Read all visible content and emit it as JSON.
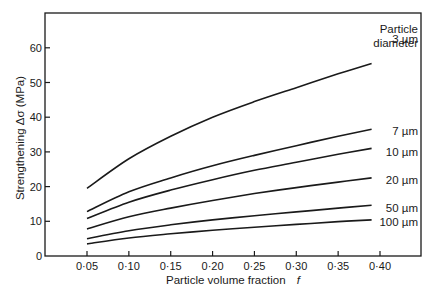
{
  "chart_data": {
    "type": "line",
    "title": "",
    "xlabel": "Particle volume fraction",
    "xlabel_symbol": "f",
    "ylabel": "Strengthening Δσ (MPa)",
    "xlim": [
      0.0,
      0.45
    ],
    "ylim": [
      0,
      70
    ],
    "x_ticks": [
      0.05,
      0.1,
      0.15,
      0.2,
      0.25,
      0.3,
      0.35,
      0.4
    ],
    "x_tick_labels": [
      "0·05",
      "0·10",
      "0·15",
      "0·20",
      "0·25",
      "0·30",
      "0·35",
      "0·40"
    ],
    "y_ticks": [
      0,
      10,
      20,
      30,
      40,
      50,
      60
    ],
    "y_tick_labels": [
      "0",
      "10",
      "20",
      "30",
      "40",
      "50",
      "60"
    ],
    "grid": false,
    "legend_title": [
      "Particle",
      "diameter"
    ],
    "legend_position": "right, inline labels at curve ends",
    "x": [
      0.05,
      0.1,
      0.15,
      0.2,
      0.25,
      0.3,
      0.35,
      0.39
    ],
    "series": [
      {
        "name": "3 µm",
        "values": [
          19.5,
          28.0,
          34.5,
          40.0,
          44.5,
          48.5,
          52.5,
          55.5
        ]
      },
      {
        "name": "7 µm",
        "values": [
          12.8,
          18.5,
          22.5,
          26.0,
          29.0,
          31.8,
          34.5,
          36.5
        ]
      },
      {
        "name": "10 µm",
        "values": [
          10.8,
          15.5,
          19.0,
          22.0,
          24.7,
          27.0,
          29.3,
          31.0
        ]
      },
      {
        "name": "20 µm",
        "values": [
          7.8,
          11.3,
          13.8,
          16.0,
          18.0,
          19.7,
          21.3,
          22.5
        ]
      },
      {
        "name": "50 µm",
        "values": [
          5.0,
          7.3,
          9.0,
          10.4,
          11.6,
          12.7,
          13.8,
          14.6
        ]
      },
      {
        "name": "100 µm",
        "values": [
          3.5,
          5.2,
          6.4,
          7.4,
          8.3,
          9.1,
          9.9,
          10.4
        ]
      }
    ]
  },
  "labels": {
    "ylabel": "Strengthening Δσ (MPa)",
    "xlabel": "Particle volume fraction",
    "xlabel_symbol": "f",
    "legend_title_1": "Particle",
    "legend_title_2": "diameter"
  }
}
